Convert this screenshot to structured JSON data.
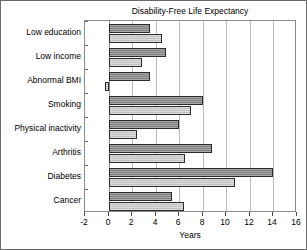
{
  "chart_data": {
    "type": "bar",
    "orientation": "horizontal",
    "title": "Disability-Free Life Expectancy",
    "xlabel": "Years",
    "ylabel": "",
    "xlim": [
      -2,
      16
    ],
    "xticks": [
      -2,
      0,
      2,
      4,
      6,
      8,
      10,
      12,
      14,
      16
    ],
    "xtick_labels": [
      "-2",
      "0",
      "2",
      "4",
      "6",
      "8",
      "10",
      "12",
      "14",
      "16"
    ],
    "grid": true,
    "grid_axis": "x",
    "legend": "none",
    "categories": [
      "Low education",
      "Low income",
      "Abnormal BMI",
      "Smoking",
      "Physical inactivity",
      "Arthritis",
      "Diabetes",
      "Cancer"
    ],
    "series": [
      {
        "name": "Series 1",
        "color": "#8e8e8e",
        "values": [
          3.5,
          4.9,
          3.5,
          8.0,
          6.0,
          8.8,
          14.0,
          5.4
        ]
      },
      {
        "name": "Series 2",
        "color": "#cfcfcf",
        "values": [
          4.5,
          2.8,
          -0.3,
          7.0,
          2.4,
          6.5,
          10.7,
          6.4
        ]
      }
    ]
  },
  "colors": {
    "series_1": "#8e8e8e",
    "series_2": "#cfcfcf",
    "bar_edge": "#2b2b2b",
    "gridline": "#bdbdbd",
    "frame": "#6b6b6b",
    "background": "#ffffff"
  }
}
